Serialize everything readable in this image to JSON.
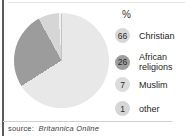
{
  "chart_data": {
    "type": "pie",
    "unit_header": "%",
    "categories": [
      "Christian",
      "African religions",
      "Muslim",
      "other"
    ],
    "values": [
      66,
      26,
      7,
      1
    ],
    "slice_colors": [
      "#e8e8e8",
      "#9c9c9c",
      "#d6d6d6",
      "#f2f2f2"
    ],
    "start_angle_deg": 0,
    "direction": "clockwise",
    "legend_position": "right",
    "source": "source: Britannica Online"
  },
  "legend": {
    "header": "%",
    "items": [
      {
        "value": "66",
        "label": "Christian",
        "badge_color": "#d8d8d8"
      },
      {
        "value": "26",
        "label": "African religions",
        "badge_color": "#9e9e9e"
      },
      {
        "value": "7",
        "label": "Muslim",
        "badge_color": "#dcdcdc"
      },
      {
        "value": "1",
        "label": "other",
        "badge_color": "#d6d6d6"
      }
    ]
  },
  "footer": {
    "source_prefix": "source:",
    "source_name": "Britannica Online"
  },
  "frame": {
    "left_rule_color": "#5c5c5c",
    "top_rule_color": "#e3e3e3",
    "bottom_rule_color": "#cfcfcf"
  }
}
